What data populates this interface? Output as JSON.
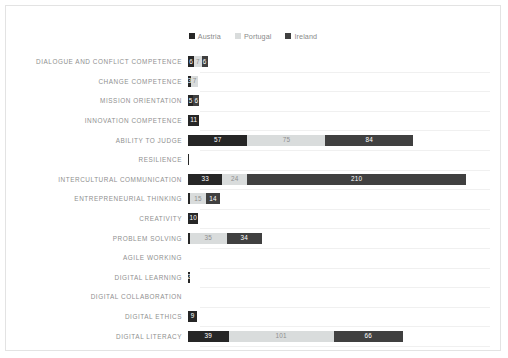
{
  "chart_data": {
    "type": "bar",
    "subtype": "stacked-horizontal-bar",
    "title": "",
    "xlabel": "",
    "ylabel": "",
    "grid": true,
    "legend_position": "top-center",
    "xlim": [
      0,
      290
    ],
    "categories": [
      "DIALOGUE AND CONFLICT COMPETENCE",
      "CHANGE COMPETENCE",
      "MISSION ORIENTATION",
      "INNOVATION COMPETENCE",
      "ABILITY TO JUDGE",
      "RESILIENCE",
      "INTERCULTURAL COMMUNICATION",
      "ENTREPRENEURIAL THINKING",
      "CREATIVITY",
      "PROBLEM SOLVING",
      "AGILE WORKING",
      "DIGITAL LEARNING",
      "DIGITAL COLLABORATION",
      "DIGITAL ETHICS",
      "DIGITAL LITERACY"
    ],
    "series": [
      {
        "name": "Austria",
        "color": "#262626",
        "values": [
          6,
          3,
          5,
          11,
          57,
          1,
          33,
          2,
          10,
          2,
          0,
          2,
          0,
          9,
          39
        ],
        "labels": [
          "6",
          "3",
          "5",
          "11",
          "57",
          "",
          "33",
          "",
          "10",
          "",
          "",
          "2",
          "",
          "9",
          "39"
        ]
      },
      {
        "name": "Portugal",
        "color": "#d9dcdc",
        "values": [
          7,
          7,
          0,
          0,
          75,
          0,
          24,
          15,
          0,
          35,
          0,
          0,
          0,
          0,
          101
        ],
        "labels": [
          "7",
          "7",
          "",
          "",
          "75",
          "",
          "24",
          "15",
          "",
          "35",
          "",
          "",
          "",
          "",
          "101"
        ]
      },
      {
        "name": "Ireland",
        "color": "#404040",
        "values": [
          6,
          0,
          6,
          0,
          84,
          0,
          210,
          14,
          0,
          34,
          0,
          0,
          0,
          0,
          66
        ],
        "labels": [
          "6",
          "",
          "6",
          "",
          "84",
          "",
          "210",
          "14",
          "",
          "34",
          "",
          "",
          "",
          "",
          "66"
        ]
      }
    ]
  },
  "legend": {
    "items": [
      {
        "label": "Austria",
        "color": "#262626"
      },
      {
        "label": "Portugal",
        "color": "#d9dcdc"
      },
      {
        "label": "Ireland",
        "color": "#404040"
      }
    ]
  },
  "colors": {
    "austria": "#262626",
    "portugal": "#d9dcdc",
    "ireland": "#404040",
    "background": "#ffffff",
    "border": "#e3e3e3",
    "gridline": "#f0f0f0",
    "category_text": "#8f8f8f",
    "legend_text": "#8a8a8a",
    "label_on_dark": "#ffffff",
    "label_on_light": "#8f8f8f"
  }
}
